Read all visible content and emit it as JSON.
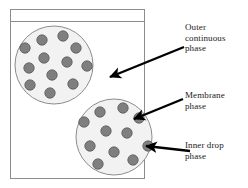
{
  "figure": {
    "width": 248,
    "height": 188,
    "background": "#ffffff"
  },
  "frame": {
    "name": "outer-rectangle",
    "x": 10,
    "y": 9,
    "width": 134,
    "height": 169,
    "stroke": "#8c8c8c",
    "fill": "#ffffff",
    "divider_y": 21
  },
  "circles": [
    {
      "name": "upper-emulsion-globule",
      "cx": 54,
      "cy": 65,
      "r": 39,
      "fill": "#f2f2f2",
      "stroke": "#8c8c8c"
    },
    {
      "name": "lower-emulsion-globule",
      "cx": 114,
      "cy": 137,
      "r": 38,
      "fill": "#f2f2f2",
      "stroke": "#8c8c8c"
    }
  ],
  "droplet": {
    "fill": "#7f7f7f",
    "stroke": "#595959",
    "radius": 5.2
  },
  "droplets_upper": [
    {
      "cx": 42,
      "cy": 40
    },
    {
      "cx": 63,
      "cy": 36
    },
    {
      "cx": 25,
      "cy": 48
    },
    {
      "cx": 76,
      "cy": 48
    },
    {
      "cx": 44,
      "cy": 58
    },
    {
      "cx": 67,
      "cy": 62
    },
    {
      "cx": 29,
      "cy": 68
    },
    {
      "cx": 87,
      "cy": 66
    },
    {
      "cx": 52,
      "cy": 75
    },
    {
      "cx": 30,
      "cy": 85
    },
    {
      "cx": 73,
      "cy": 84
    },
    {
      "cx": 50,
      "cy": 93
    }
  ],
  "droplets_lower": [
    {
      "cx": 100,
      "cy": 112
    },
    {
      "cx": 123,
      "cy": 108
    },
    {
      "cx": 84,
      "cy": 122
    },
    {
      "cx": 139,
      "cy": 118
    },
    {
      "cx": 106,
      "cy": 131
    },
    {
      "cx": 127,
      "cy": 133
    },
    {
      "cx": 90,
      "cy": 146
    },
    {
      "cx": 148,
      "cy": 146
    },
    {
      "cx": 114,
      "cy": 152
    },
    {
      "cx": 133,
      "cy": 160
    },
    {
      "cx": 98,
      "cy": 164
    }
  ],
  "arrows": [
    {
      "name": "arrow-outer-continuous-phase",
      "x1": 184,
      "y1": 47,
      "x2": 110,
      "y2": 77,
      "color": "#000000",
      "width": 2.4
    },
    {
      "name": "arrow-membrane-phase",
      "x1": 183,
      "y1": 99,
      "x2": 134,
      "y2": 119,
      "color": "#000000",
      "width": 2.4
    },
    {
      "name": "arrow-inner-drop-phase",
      "x1": 190,
      "y1": 151,
      "x2": 146,
      "y2": 146,
      "color": "#000000",
      "width": 2.4
    }
  ],
  "labels": {
    "outer": "Outer\ncontinuous\nphase",
    "membrane": "Membrane\nphase",
    "inner": "Inner drop\nphase"
  }
}
